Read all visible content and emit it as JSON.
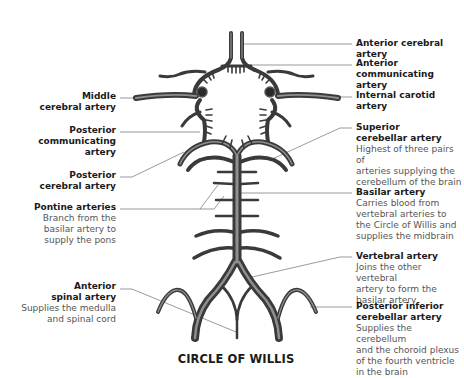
{
  "title": "CIRCLE OF WILLIS",
  "colors": {
    "vessel_dark": "#3a3a3a",
    "vessel_mid": "#7a7a7a",
    "vessel_light": "#b8b8b8",
    "leader_line": "#6e6e6e",
    "label_bold": "#1a1a1a",
    "label_desc": "#555555"
  },
  "labels": {
    "right": [
      {
        "id": "anterior-cerebral-artery",
        "title": "Anterior cerebral artery",
        "desc": ""
      },
      {
        "id": "anterior-communicating-artery",
        "title": "Anterior\ncommunicating artery",
        "desc": ""
      },
      {
        "id": "internal-carotid-artery",
        "title": "Internal carotid\nartery",
        "desc": ""
      },
      {
        "id": "superior-cerebellar-artery",
        "title": "Superior\ncerebellar artery",
        "desc": "Highest of three pairs of\narteries supplying the\ncerebellum of the brain"
      },
      {
        "id": "basilar-artery",
        "title": "Basilar artery",
        "desc": "Carries blood from\nvertebral arteries to\nthe Circle of Willis and\nsupplies the midbrain"
      },
      {
        "id": "vertebral-artery",
        "title": "Vertebral artery",
        "desc": "Joins the other vertebral\nartery to form the\nbasilar artery"
      },
      {
        "id": "posterior-inferior-cerebellar-artery",
        "title": "Posterior inferior\ncerebellar artery",
        "desc": "Supplies the cerebellum\nand the choroid plexus\nof the fourth ventricle\nin the brain"
      }
    ],
    "left": [
      {
        "id": "middle-cerebral-artery",
        "title": "Middle\ncerebral artery",
        "desc": ""
      },
      {
        "id": "posterior-communicating-artery",
        "title": "Posterior\ncommunicating\nartery",
        "desc": ""
      },
      {
        "id": "posterior-cerebral-artery",
        "title": "Posterior\ncerebral artery",
        "desc": ""
      },
      {
        "id": "pontine-arteries",
        "title": "Pontine arteries",
        "desc": "Branch from the\nbasilar artery to\nsupply the pons"
      },
      {
        "id": "anterior-spinal-artery",
        "title": "Anterior\nspinal artery",
        "desc": "Supplies the medulla\nand spinal cord"
      }
    ]
  }
}
